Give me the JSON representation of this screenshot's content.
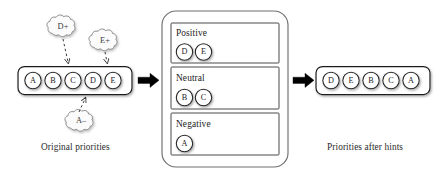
{
  "diagram": {
    "title_left": "Original priorities",
    "title_right": "Priorities after hints",
    "colors": {
      "stroke": "#1f1f1f",
      "arrow": "#000000",
      "cloud_stroke": "#8d8d8d",
      "cloud_fill": "#fbfbfb",
      "shadow": "#b9b9b9",
      "background": "#ffffff"
    },
    "left_queue": {
      "name": "original-priority-queue",
      "nodes": [
        {
          "label": "A"
        },
        {
          "label": "B"
        },
        {
          "label": "C"
        },
        {
          "label": "D"
        },
        {
          "label": "E"
        }
      ]
    },
    "hints": [
      {
        "label": "D+",
        "direction": "down",
        "target": "D"
      },
      {
        "label": "E+",
        "direction": "down",
        "target": "E"
      },
      {
        "label": "A–",
        "direction": "up",
        "target": "A"
      }
    ],
    "classifier": {
      "name": "sentiment-classifier",
      "groups": [
        {
          "label": "Positive",
          "nodes": [
            {
              "label": "D"
            },
            {
              "label": "E"
            }
          ]
        },
        {
          "label": "Neutral",
          "nodes": [
            {
              "label": "B"
            },
            {
              "label": "C"
            }
          ]
        },
        {
          "label": "Negative",
          "nodes": [
            {
              "label": "A"
            }
          ]
        }
      ]
    },
    "right_queue": {
      "name": "reordered-priority-queue",
      "nodes": [
        {
          "label": "D"
        },
        {
          "label": "E"
        },
        {
          "label": "B"
        },
        {
          "label": "C"
        },
        {
          "label": "A"
        }
      ]
    },
    "flow_arrows": [
      {
        "name": "arrow-left-to-classifier"
      },
      {
        "name": "arrow-classifier-to-right"
      }
    ]
  }
}
